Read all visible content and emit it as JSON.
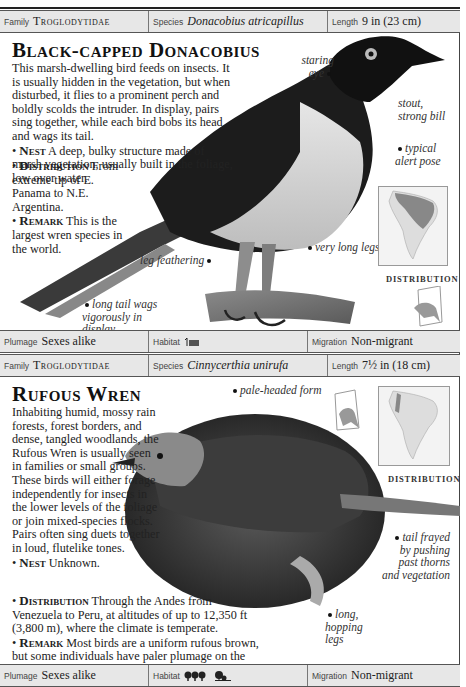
{
  "page": {
    "running_head": "TROGLODYTIDAE · 261"
  },
  "entries": [
    {
      "info": {
        "family_label": "Family",
        "family_value": "Troglodytidae",
        "species_label": "Species",
        "species_value": "Donacobius atricapillus",
        "length_label": "Length",
        "length_value": "9 in (23 cm)"
      },
      "title": "Black-capped Donacobius",
      "intro": "This marsh-dwelling bird feeds on insects. It is usually hidden in the vegetation, but when disturbed, it flies to a prominent perch and boldly scolds the intruder. In display, pairs sing together, while each bird bobs its head and wags its tail.",
      "nest_label": "Nest",
      "nest_text": "A deep, bulky structure made of marsh vegetation, usually built in the foliage, low over water.",
      "distribution_label": "Distribution",
      "distribution_text": "From extreme tip of E. Panama to N.E. Argentina.",
      "remark_label": "Remark",
      "remark_text": "This is the largest wren species in the world.",
      "annotations": {
        "eye": "staring eye",
        "bill": "stout, strong bill",
        "pose": "typical alert pose",
        "legs": "very long legs",
        "feathering": "leg feathering",
        "tail": "long tail wags vigorously in display"
      },
      "map_label": "DISTRIBUTION",
      "footer": {
        "plumage_label": "Plumage",
        "plumage_value": "Sexes alike",
        "habitat_label": "Habitat",
        "habitat_icons": [
          "marsh-water-icon"
        ],
        "migration_label": "Migration",
        "migration_value": "Non-migrant"
      }
    },
    {
      "info": {
        "family_label": "Family",
        "family_value": "Troglodytidae",
        "species_label": "Species",
        "species_value": "Cinnycerthia unirufa",
        "length_label": "Length",
        "length_value": "7½ in (18 cm)"
      },
      "title": "Rufous Wren",
      "intro": "Inhabiting humid, mossy rain forests, forest borders, and dense, tangled woodlands, the Rufous Wren is usually seen in families or small groups. These birds will either forage independently for insects in the lower levels of the foliage or join mixed-species flocks. Pairs often sing duets together in loud, flutelike tones.",
      "nest_label": "Nest",
      "nest_text": "Unknown.",
      "distribution_label": "Distribution",
      "distribution_text": "Through the Andes from Venezuela to Peru, at altitudes of up to 12,350 ft (3,800 m), where the climate is temperate.",
      "remark_label": "Remark",
      "remark_text": "Most birds are a uniform rufous brown, but some individuals have paler plumage on the head.",
      "annotations": {
        "pale_head": "pale-headed form",
        "tail": "tail frayed by pushing past thorns and vegetation",
        "legs": "long, hopping legs"
      },
      "map_label": "DISTRIBUTION",
      "footer": {
        "plumage_label": "Plumage",
        "plumage_value": "Sexes alike",
        "habitat_label": "Habitat",
        "habitat_icons": [
          "forest-icon",
          "woodland-icon"
        ],
        "migration_label": "Migration",
        "migration_value": "Non-migrant"
      }
    }
  ]
}
